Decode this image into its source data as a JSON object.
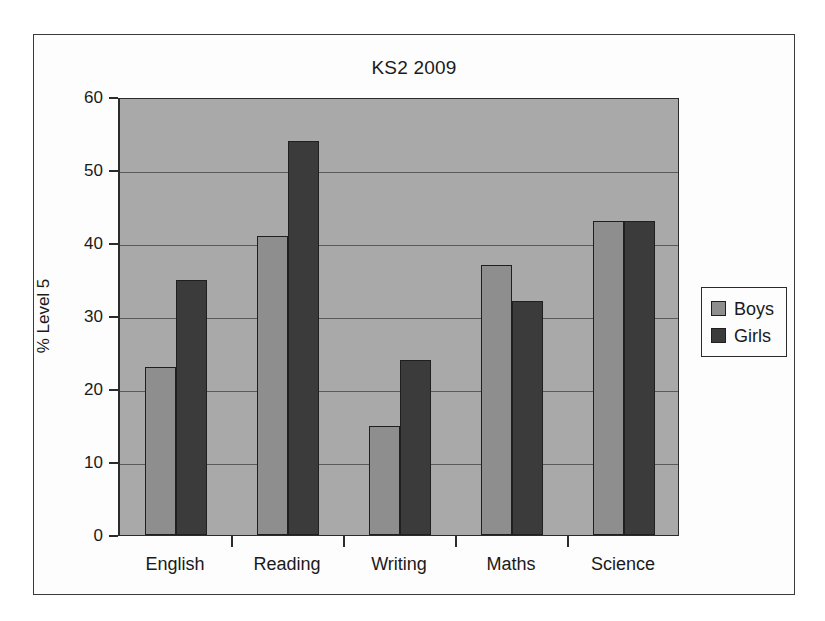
{
  "chart_data": {
    "type": "bar",
    "title": "KS2 2009",
    "xlabel": "",
    "ylabel": "% Level 5",
    "ylim": [
      0,
      60
    ],
    "yticks": [
      0,
      10,
      20,
      30,
      40,
      50,
      60
    ],
    "grid": true,
    "legend_position": "right",
    "categories": [
      "English",
      "Reading",
      "Writing",
      "Maths",
      "Science"
    ],
    "series": [
      {
        "name": "Boys",
        "color": "#8e8e8e",
        "values": [
          23,
          41,
          15,
          37,
          43
        ]
      },
      {
        "name": "Girls",
        "color": "#3b3b3b",
        "values": [
          35,
          54,
          24,
          32,
          43
        ]
      }
    ]
  },
  "legend": {
    "entries": [
      {
        "label": "Boys"
      },
      {
        "label": "Girls"
      }
    ]
  },
  "axis": {
    "y_title": "% Level 5",
    "y_tick_labels": [
      "0",
      "10",
      "20",
      "30",
      "40",
      "50",
      "60"
    ]
  }
}
